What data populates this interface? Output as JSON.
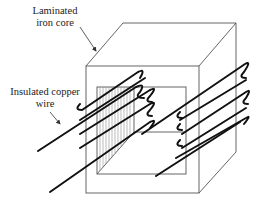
{
  "diagram": {
    "type": "transformer-core-winding",
    "labels": {
      "core_line1": "Laminated",
      "core_line2": "iron core",
      "wire_line1": "Insulated copper",
      "wire_line2": "wire"
    },
    "colors": {
      "outline": "#555555",
      "wire": "#111111",
      "hatch": "#666666",
      "text": "#222222"
    },
    "winding_turns_left": 4,
    "winding_turns_right": 4
  }
}
